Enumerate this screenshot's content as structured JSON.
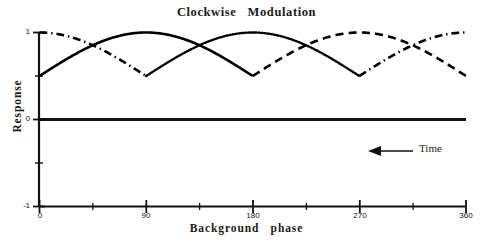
{
  "chart_data": {
    "type": "line",
    "title": "Clockwise   Modulation",
    "xlabel": "Background   phase",
    "ylabel": "Response",
    "xlim": [
      0,
      360
    ],
    "ylim": [
      -1,
      1
    ],
    "grid": false,
    "legend": "none",
    "xticks": [
      0,
      90,
      180,
      270,
      360
    ],
    "xticklabels": [
      "0",
      "90",
      "180",
      "270",
      "360"
    ],
    "xminorticks": [
      45,
      135,
      225,
      315
    ],
    "yticks": [
      1,
      0,
      -1
    ],
    "yticklabels": [
      "1",
      "0",
      "-1"
    ],
    "yminorticks": [
      0.5,
      -0.5
    ],
    "baseline_y": 0,
    "annotations": [
      {
        "name": "time-arrow",
        "text": "Time",
        "x": 300,
        "y": -0.27,
        "arrow_direction": "left"
      }
    ],
    "series": [
      {
        "name": "lobe-solid",
        "linestyle": "solid",
        "color": "#000000",
        "linewidth": 2.6,
        "phase_start": 0,
        "phase_end": 180,
        "peak_x": 90,
        "peak_y": 1,
        "description": "sin-squared half-lobe rising from 0 at 0 deg to 1 at 90 deg, back to 0 at 180 deg"
      },
      {
        "name": "lobe-dotted",
        "linestyle": "dotted",
        "color": "#000000",
        "linewidth": 2.4,
        "phase_start": 90,
        "phase_end": 270,
        "peak_x": 180,
        "peak_y": 1,
        "description": "sin-squared half-lobe rising from 0 at 90 deg to 1 at 180 deg, back to 0 at 270 deg"
      },
      {
        "name": "lobe-dashed",
        "linestyle": "dashed",
        "color": "#000000",
        "linewidth": 2.6,
        "phase_start": 180,
        "phase_end": 360,
        "peak_x": 270,
        "peak_y": 1,
        "description": "sin-squared half-lobe rising from 0 at 180 deg to 1 at 270 deg, back to 0 at 360 deg"
      },
      {
        "name": "lobe-dashdot-a",
        "linestyle": "dashdot",
        "color": "#000000",
        "linewidth": 2.6,
        "phase_start": 0,
        "phase_end": 90,
        "peak_x": 0,
        "peak_y": 1,
        "description": "tail of sin-squared lobe descending from 1 at 0 deg to 0 at 90 deg"
      },
      {
        "name": "lobe-dashdot-b",
        "linestyle": "dashdot",
        "color": "#000000",
        "linewidth": 2.6,
        "phase_start": 270,
        "phase_end": 360,
        "peak_x": 360,
        "peak_y": 1,
        "description": "head of sin-squared lobe rising from 0 at 270 deg to 1 at 360 deg"
      }
    ],
    "sampled_values": {
      "x_deg": [
        0,
        15,
        30,
        45,
        60,
        75,
        90,
        105,
        120,
        135,
        150,
        165,
        180,
        195,
        210,
        225,
        240,
        255,
        270,
        285,
        300,
        315,
        330,
        345,
        360
      ],
      "lobe_solid": [
        0,
        0.067,
        0.25,
        0.5,
        0.75,
        0.933,
        1,
        0.933,
        0.75,
        0.5,
        0.25,
        0.067,
        0,
        null,
        null,
        null,
        null,
        null,
        null,
        null,
        null,
        null,
        null,
        null,
        null
      ],
      "lobe_dotted": [
        null,
        null,
        null,
        null,
        null,
        null,
        0,
        0.067,
        0.25,
        0.5,
        0.75,
        0.933,
        1,
        0.933,
        0.75,
        0.5,
        0.25,
        0.067,
        0,
        null,
        null,
        null,
        null,
        null,
        null
      ],
      "lobe_dashed": [
        null,
        null,
        null,
        null,
        null,
        null,
        null,
        null,
        null,
        null,
        null,
        null,
        0,
        0.067,
        0.25,
        0.5,
        0.75,
        0.933,
        1,
        0.933,
        0.75,
        0.5,
        0.25,
        0.067,
        0
      ],
      "lobe_dashdot_a": [
        1,
        0.933,
        0.75,
        0.5,
        0.25,
        0.067,
        0,
        null,
        null,
        null,
        null,
        null,
        null,
        null,
        null,
        null,
        null,
        null,
        null,
        null,
        null,
        null,
        null,
        null,
        null
      ],
      "lobe_dashdot_b": [
        null,
        null,
        null,
        null,
        null,
        null,
        null,
        null,
        null,
        null,
        null,
        null,
        null,
        null,
        null,
        null,
        null,
        null,
        0,
        0.067,
        0.25,
        0.5,
        0.75,
        0.933,
        1
      ]
    }
  },
  "axis": {
    "ytick_top": "1",
    "ytick_mid": "0",
    "ytick_bottom": "-1",
    "xtick_0": "0",
    "xtick_90": "90",
    "xtick_180": "180",
    "xtick_270": "270",
    "xtick_360": "360"
  },
  "annotation": {
    "time_label": "Time"
  }
}
